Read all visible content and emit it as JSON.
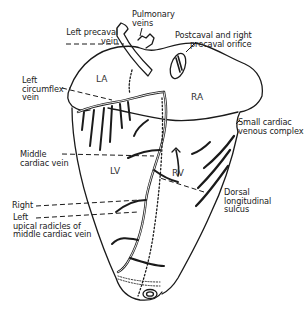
{
  "diagram": {
    "stroke_color": "#1a1a1a",
    "background": "#ffffff",
    "chambers": [
      {
        "id": "LA",
        "label": "LA"
      },
      {
        "id": "RA",
        "label": "RA"
      },
      {
        "id": "LV",
        "label": "LV"
      },
      {
        "id": "RV",
        "label": "RV"
      }
    ],
    "labels": {
      "pulmonary_veins": "Pulmonary\nveins",
      "left_precaval_vein": "Left precaval\nvein",
      "postcaval_orifice": "Postcaval and right\n      precaval orifice",
      "left_circumflex_vein": "Left\ncircumflex\nvein",
      "small_cardiac_venous_complex": "Small cardiac\nvenous complex",
      "middle_cardiac_vein": "Middle\ncardiac vein",
      "dorsal_longitudinal_sulcus": "Dorsal\nlongitudinal\nsulcus",
      "right": "Right",
      "left_apical_radicles": "Left\nupical radicles of\nmiddle cardiac vein"
    }
  }
}
